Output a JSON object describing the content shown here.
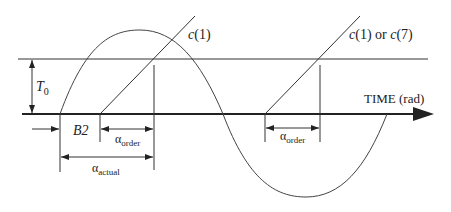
{
  "diagram": {
    "labels": {
      "c1": "c (1)",
      "c1_or_c7": "c (1) or c (7)",
      "t0_base": "T",
      "t0_sub": "0",
      "b2": "B2",
      "alpha_order_base": "α",
      "alpha_order_sub": "order",
      "alpha_order2_base": "α",
      "alpha_order2_sub": "order",
      "alpha_actual_base": "α",
      "alpha_actual_sub": "actual",
      "time_axis": "TIME (rad)"
    },
    "colors": {
      "stroke": "#333333",
      "background": "#ffffff"
    }
  }
}
